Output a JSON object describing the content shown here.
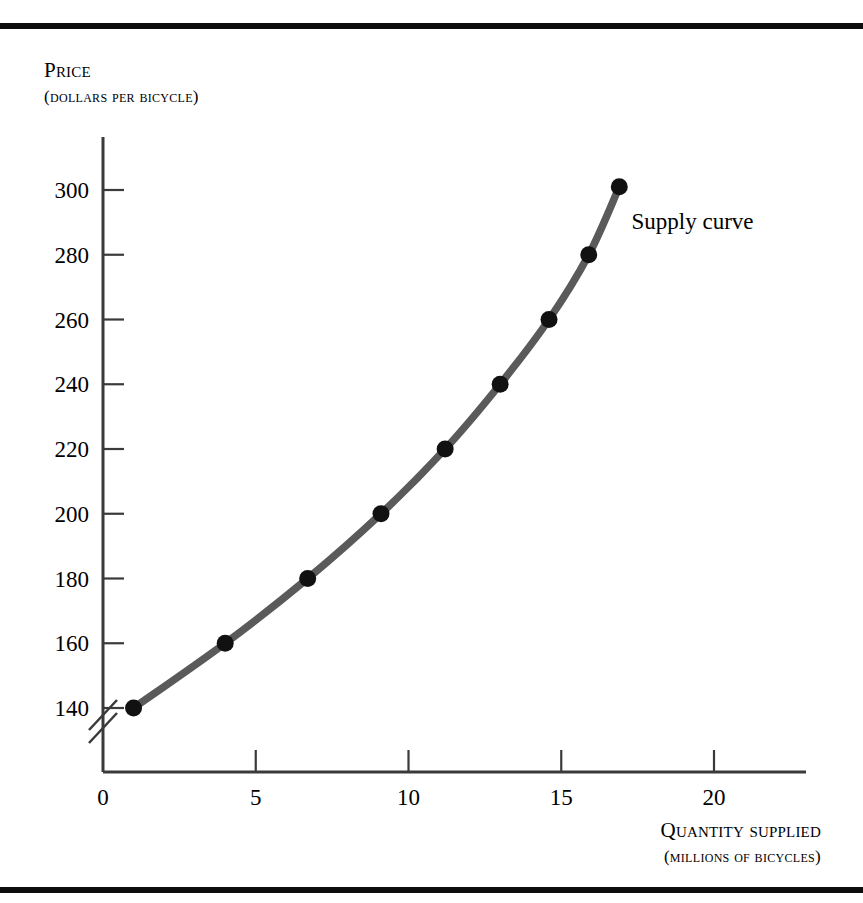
{
  "figure": {
    "rules": {
      "top_label": "top-rule",
      "bottom_label": "bottom-rule"
    },
    "y_axis_title_line1": "Price",
    "y_axis_title_line2": "(dollars per bicycle)",
    "x_axis_title_line1": "Quantity supplied",
    "x_axis_title_line2": "(millions of bicycles)",
    "curve_label": "Supply curve",
    "axis_break_symbol": "//"
  },
  "colors": {
    "rule": "#0d0d0d",
    "axis": "#3a3a3a",
    "curve": "#5a5a5a",
    "marker": "#111111",
    "text": "#000000",
    "background": "#ffffff"
  },
  "chart_data": {
    "type": "line",
    "title": "",
    "subtitle": "",
    "xlabel": "Quantity supplied (millions of bicycles)",
    "ylabel": "Price (dollars per bicycle)",
    "xlim": [
      0,
      23
    ],
    "ylim": [
      130,
      312
    ],
    "y_axis_broken": true,
    "y_axis_break_below": 140,
    "grid": false,
    "legend_position": "none",
    "xticks": [
      0,
      5,
      10,
      15,
      20
    ],
    "xtick_labels": [
      "0",
      "5",
      "10",
      "15",
      "20"
    ],
    "yticks": [
      140,
      160,
      180,
      200,
      220,
      240,
      260,
      280,
      300
    ],
    "ytick_labels": [
      "140",
      "160",
      "180",
      "200",
      "220",
      "240",
      "260",
      "280",
      "300"
    ],
    "series": [
      {
        "name": "Supply curve",
        "marker": "circle",
        "x": [
          1.0,
          4.0,
          6.7,
          9.1,
          11.2,
          13.0,
          14.6,
          15.9,
          16.9
        ],
        "y": [
          140,
          160,
          180,
          200,
          220,
          240,
          260,
          280,
          301
        ],
        "points": [
          {
            "quantity": 1.0,
            "price": 140
          },
          {
            "quantity": 4.0,
            "price": 160
          },
          {
            "quantity": 6.7,
            "price": 180
          },
          {
            "quantity": 9.1,
            "price": 200
          },
          {
            "quantity": 11.2,
            "price": 220
          },
          {
            "quantity": 13.0,
            "price": 240
          },
          {
            "quantity": 14.6,
            "price": 260
          },
          {
            "quantity": 15.9,
            "price": 280
          },
          {
            "quantity": 16.9,
            "price": 301
          }
        ]
      }
    ],
    "annotations": [
      {
        "text": "Supply curve",
        "x": 17.3,
        "y": 288
      }
    ]
  }
}
